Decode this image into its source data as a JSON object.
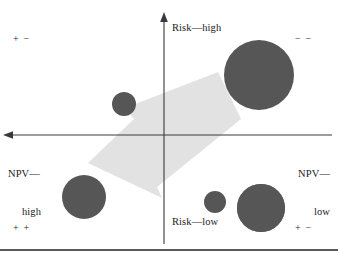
{
  "figure": {
    "name": "risk-npv-portfolio-matrix",
    "axes": {
      "vertical": {
        "top_label": "Risk—high",
        "bottom_label": "Risk—low"
      },
      "horizontal": {
        "left_label_line1": "NPV—",
        "left_label_line2": "high",
        "right_label_line1": "NPV—",
        "right_label_line2": "low"
      }
    },
    "quadrant_marks": {
      "top_left": "+ −",
      "top_right": "− −",
      "bottom_left": "+ +",
      "bottom_right": "+ −"
    },
    "colors": {
      "bubble_fill": "#565656",
      "arrow_fill": "#e2e2e2",
      "axis_stroke": "#3a3a3a",
      "rule_stroke": "#222222",
      "background": "#ffffff"
    }
  },
  "chart_data": {
    "type": "scatter",
    "title": "",
    "xlabel": "NPV",
    "ylabel": "Risk",
    "xlim": [
      0,
      338
    ],
    "ylim": [
      0,
      244
    ],
    "grid": false,
    "legend": "none",
    "axis_origin": {
      "x": 164,
      "y": 135
    },
    "annotations": [
      {
        "text": "Risk—high",
        "x": 172,
        "y": 28,
        "role": "axis-tip-label"
      },
      {
        "text": "Risk—low",
        "x": 172,
        "y": 222,
        "role": "axis-tip-label"
      },
      {
        "text": "NPV—high",
        "x": 8,
        "y": 149,
        "role": "axis-tip-label"
      },
      {
        "text": "NPV—low",
        "x": 330,
        "y": 149,
        "role": "axis-tip-label"
      },
      {
        "text": "+ −",
        "x": 13,
        "y": 38,
        "role": "quadrant-mark"
      },
      {
        "text": "− −",
        "x": 295,
        "y": 38,
        "role": "quadrant-mark"
      },
      {
        "text": "+ +",
        "x": 13,
        "y": 227,
        "role": "quadrant-mark"
      },
      {
        "text": "+ −",
        "x": 295,
        "y": 227,
        "role": "quadrant-mark"
      }
    ],
    "series": [
      {
        "name": "projects",
        "points": [
          {
            "id": "bubble-1",
            "cx": 85,
            "cy": 75,
            "r": 23,
            "quadrant": "top-left"
          },
          {
            "id": "bubble-2",
            "cx": 124,
            "cy": 104,
            "r": 12,
            "quadrant": "top-left"
          },
          {
            "id": "bubble-3",
            "cx": 259,
            "cy": 75,
            "r": 35,
            "quadrant": "top-right"
          },
          {
            "id": "bubble-4",
            "cx": 84,
            "cy": 197,
            "r": 22,
            "quadrant": "bottom-left"
          },
          {
            "id": "bubble-5",
            "cx": 215,
            "cy": 202,
            "r": 11,
            "quadrant": "bottom-right"
          },
          {
            "id": "bubble-6",
            "cx": 261,
            "cy": 208,
            "r": 24,
            "quadrant": "bottom-right"
          }
        ]
      }
    ],
    "shapes": [
      {
        "id": "flow-arrow",
        "type": "arrow",
        "direction": "down-left",
        "fill": "#e2e2e2",
        "polygon": "218,72 240,118 156,186 160,196 89,163 135,119 126,109"
      }
    ]
  }
}
